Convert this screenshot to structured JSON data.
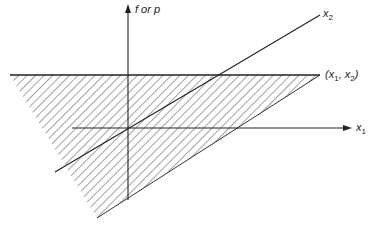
{
  "diagram": {
    "type": "3d-axes-with-shaded-plane",
    "labels": {
      "vertical_axis": "f or p",
      "x1_axis_main": "x",
      "x1_axis_sub": "1",
      "x2_axis_main": "x",
      "x2_axis_sub": "2",
      "point_prefix": "(x",
      "point_sub1": "1",
      "point_mid": ", x",
      "point_sub2": "2",
      "point_suffix": ")"
    },
    "colors": {
      "line": "#222222",
      "hatch": "#555555",
      "background": "#ffffff"
    },
    "geometry": {
      "vertical_axis": {
        "x": 128,
        "y_bottom": 200,
        "y_top": 5
      },
      "x1_axis": {
        "y": 128,
        "x_start": 72,
        "x_end": 352
      },
      "x2_axis": {
        "x_start": 55,
        "y_start": 172,
        "x_end": 320,
        "y_end": 15
      },
      "shaded_triangle": [
        [
          10,
          75
        ],
        [
          320,
          75
        ],
        [
          97,
          218
        ]
      ]
    }
  }
}
